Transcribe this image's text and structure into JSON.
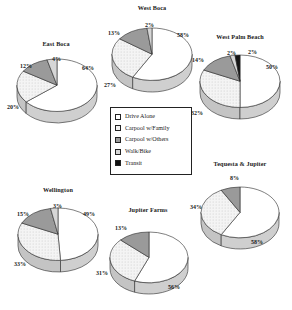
{
  "legend": {
    "name": "mode-legend",
    "items": [
      {
        "label": "Drive Alone",
        "key": "drive_alone",
        "color": "#ffffff",
        "pattern": "solid-white"
      },
      {
        "label": "Carpool w/Family",
        "key": "carpool_family",
        "color": "#eeeeee",
        "pattern": "light-dots"
      },
      {
        "label": "Carpool w/Others",
        "key": "carpool_others",
        "color": "#9a9a9a",
        "pattern": "mid-gray"
      },
      {
        "label": "Walk/Bike",
        "key": "walk_bike",
        "color": "#d4d4d4",
        "pattern": "light-gray"
      },
      {
        "label": "Transit",
        "key": "transit",
        "color": "#111111",
        "pattern": "solid-black"
      }
    ]
  },
  "chart_data": [
    {
      "type": "pie",
      "name": "east-boca",
      "title": "East Boca",
      "categories": [
        "Drive Alone",
        "Carpool w/Family",
        "Carpool w/Others",
        "Walk/Bike"
      ],
      "values": [
        64,
        20,
        12,
        4
      ],
      "labels": [
        "64%",
        "20%",
        "12%",
        "4%"
      ],
      "unit": "%"
    },
    {
      "type": "pie",
      "name": "west-boca",
      "title": "West Boca",
      "categories": [
        "Drive Alone",
        "Carpool w/Family",
        "Carpool w/Others",
        "Walk/Bike"
      ],
      "values": [
        58,
        27,
        13,
        2
      ],
      "labels": [
        "58%",
        "27%",
        "13%",
        "2%"
      ],
      "unit": "%"
    },
    {
      "type": "pie",
      "name": "west-palm-beach",
      "title": "West Palm Beach",
      "categories": [
        "Drive Alone",
        "Carpool w/Family",
        "Carpool w/Others",
        "Walk/Bike",
        "Transit"
      ],
      "values": [
        50,
        32,
        14,
        2,
        2
      ],
      "labels": [
        "50%",
        "32%",
        "14%",
        "2%",
        "2%"
      ],
      "unit": "%"
    },
    {
      "type": "pie",
      "name": "wellington",
      "title": "Wellington",
      "categories": [
        "Drive Alone",
        "Carpool w/Family",
        "Carpool w/Others",
        "Walk/Bike"
      ],
      "values": [
        49,
        33,
        15,
        3
      ],
      "labels": [
        "49%",
        "33%",
        "15%",
        "3%"
      ],
      "unit": "%"
    },
    {
      "type": "pie",
      "name": "jupiter-farms",
      "title": "Jupiter Farms",
      "categories": [
        "Drive Alone",
        "Carpool w/Family",
        "Carpool w/Others"
      ],
      "values": [
        56,
        31,
        13
      ],
      "labels": [
        "56%",
        "31%",
        "13%"
      ],
      "unit": "%"
    },
    {
      "type": "pie",
      "name": "tequesta-jupiter",
      "title": "Tequesta & Jupiter",
      "categories": [
        "Drive Alone",
        "Carpool w/Family",
        "Carpool w/Others"
      ],
      "values": [
        58,
        34,
        8
      ],
      "labels": [
        "58%",
        "34%",
        "8%"
      ],
      "unit": "%"
    }
  ]
}
